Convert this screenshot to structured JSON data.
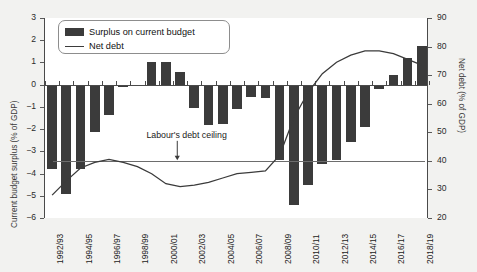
{
  "chart_data": {
    "type": "bar",
    "title": "",
    "xlabel": "",
    "ylabel": "Current budget surplus (% of GDP)",
    "y2label": "Net debt (% of GDP)",
    "ylim": [
      -6,
      3
    ],
    "y2lim": [
      20,
      90
    ],
    "yticks": [
      "3",
      "2",
      "1",
      "0",
      "-1",
      "-2",
      "-3",
      "-4",
      "-5",
      "-6"
    ],
    "y2ticks": [
      "90",
      "80",
      "70",
      "60",
      "50",
      "40",
      "30",
      "20"
    ],
    "grid": false,
    "legend_position": "top-left",
    "categories": [
      "1992/93",
      "1993/94",
      "1994/95",
      "1995/96",
      "1996/97",
      "1997/98",
      "1998/99",
      "1999/00",
      "2000/01",
      "2001/02",
      "2002/03",
      "2003/04",
      "2004/05",
      "2005/06",
      "2006/07",
      "2007/08",
      "2008/09",
      "2009/10",
      "2010/11",
      "2011/12",
      "2012/13",
      "2013/14",
      "2014/15",
      "2015/16",
      "2016/17",
      "2017/18",
      "2018/19"
    ],
    "xtick_labels": [
      "1992/93",
      "1994/95",
      "1996/97",
      "1998/99",
      "2000/01",
      "2002/03",
      "2004/05",
      "2006/07",
      "2008/09",
      "2010/11",
      "2012/13",
      "2014/15",
      "2016/17",
      "2018/19"
    ],
    "series": [
      {
        "name": "Surplus on current budget",
        "type": "bar",
        "axis": "left",
        "color": "#3b3b3b",
        "values": [
          -3.8,
          -4.9,
          -3.8,
          -2.15,
          -1.35,
          -0.1,
          0.0,
          1.0,
          1.0,
          0.55,
          -1.05,
          -1.8,
          -1.75,
          -1.1,
          -0.55,
          -0.6,
          -3.4,
          -5.4,
          -4.5,
          -3.55,
          -3.4,
          -2.6,
          -1.9,
          -0.2,
          0.45,
          1.2,
          1.75
        ]
      },
      {
        "name": "Net debt",
        "type": "line",
        "axis": "right",
        "color": "#3b3b3b",
        "values": [
          28.0,
          33.0,
          37.5,
          39.5,
          40.5,
          39.5,
          38.0,
          35.5,
          32.0,
          31.0,
          31.5,
          32.5,
          34.0,
          35.5,
          36.0,
          36.5,
          42.0,
          55.0,
          64.0,
          70.5,
          74.5,
          77.0,
          78.5,
          78.5,
          77.5,
          75.5,
          73.5
        ]
      }
    ],
    "annotations": [
      {
        "text": "Labour's debt ceiling",
        "value": 40,
        "axis": "right",
        "arrow": "down"
      }
    ]
  },
  "legend": {
    "items": [
      {
        "label": "Surplus on current budget",
        "marker": "bar"
      },
      {
        "label": "Net debt",
        "marker": "line"
      }
    ]
  }
}
